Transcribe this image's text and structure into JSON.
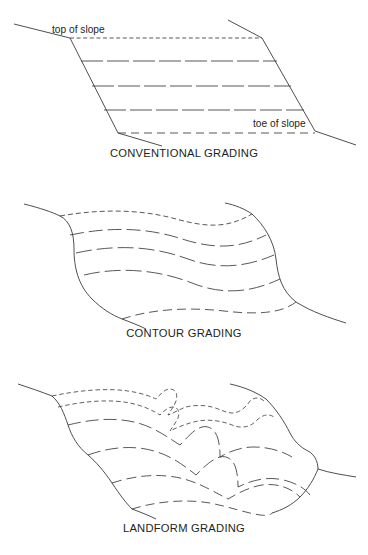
{
  "diagram": {
    "title_semantics": "grading-styles-comparison",
    "panels": [
      {
        "id": "conventional",
        "caption": "CONVENTIONAL GRADING",
        "labels": [
          {
            "text": "top of slope",
            "x": 52,
            "y": 33
          },
          {
            "text": "toe of slope",
            "x": 253,
            "y": 127
          }
        ],
        "description": "Straight parallel contour lines between angular top and toe of slope lines"
      },
      {
        "id": "contour",
        "caption": "CONTOUR GRADING",
        "labels": [],
        "description": "Smooth S-curved contour lines with rounded slope edges"
      },
      {
        "id": "landform",
        "caption": "LANDFORM GRADING",
        "labels": [],
        "description": "Undulating contours with ridges and swales mimicking natural terrain"
      }
    ]
  },
  "style": {
    "line_color": "#3a3a3c",
    "text_color": "#231f20",
    "background": "#ffffff"
  }
}
